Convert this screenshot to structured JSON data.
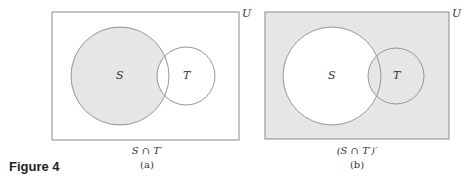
{
  "figure_label": "Figure 4",
  "colors": {
    "shade": "#e6e6e6",
    "stroke": "#8a8a8a",
    "white": "#ffffff"
  },
  "panels": [
    {
      "id": "a",
      "universe_label": "U",
      "set_s_label": "S",
      "set_t_label": "T",
      "expression": "S ∩ T′",
      "sublabel": "(a)",
      "shaded_region": "S minus T"
    },
    {
      "id": "b",
      "universe_label": "U",
      "set_s_label": "S",
      "set_t_label": "T",
      "expression": "(S ∩ T′)′",
      "sublabel": "(b)",
      "shaded_region": "complement of S minus T"
    }
  ]
}
